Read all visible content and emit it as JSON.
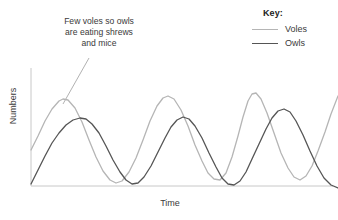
{
  "chart_data": {
    "type": "line",
    "title": "",
    "xlabel": "Time",
    "ylabel": "Numbers",
    "grid": false,
    "axes": {
      "x_axis_line": true,
      "y_axis_line": true,
      "ticks": false,
      "tick_labels": false,
      "plot_left": 31,
      "plot_right": 338,
      "plot_top": 60,
      "plot_bottom": 186
    },
    "legend": {
      "title": "Key:",
      "position": "top-right",
      "entries": [
        {
          "name": "Voles",
          "color": "#b5b5b5"
        },
        {
          "name": "Owls",
          "color": "#555555"
        }
      ]
    },
    "annotations": [
      {
        "text": "Few voles so owls are eating shrews and mice",
        "lines": [
          "Few voles so owls",
          "are eating shrews",
          "and mice"
        ],
        "leader_line_from": [
          89,
          58
        ],
        "leader_line_to": [
          63,
          104
        ]
      }
    ],
    "series": [
      {
        "name": "Voles",
        "color": "#b5b5b5",
        "width": 1.3,
        "cycles": 3.2,
        "phase_lead_fraction": 0.22,
        "points": [
          [
            31,
            150
          ],
          [
            38,
            136
          ],
          [
            45,
            121
          ],
          [
            52,
            109
          ],
          [
            59,
            101
          ],
          [
            63,
            99
          ],
          [
            68,
            100
          ],
          [
            75,
            108
          ],
          [
            82,
            122
          ],
          [
            89,
            140
          ],
          [
            96,
            157
          ],
          [
            103,
            171
          ],
          [
            110,
            180
          ],
          [
            116,
            183
          ],
          [
            122,
            181
          ],
          [
            129,
            172
          ],
          [
            136,
            158
          ],
          [
            143,
            140
          ],
          [
            150,
            121
          ],
          [
            157,
            106
          ],
          [
            163,
            98
          ],
          [
            168,
            96
          ],
          [
            174,
            99
          ],
          [
            181,
            110
          ],
          [
            188,
            126
          ],
          [
            195,
            145
          ],
          [
            202,
            161
          ],
          [
            208,
            173
          ],
          [
            214,
            179
          ],
          [
            220,
            180
          ],
          [
            226,
            173
          ],
          [
            232,
            157
          ],
          [
            238,
            136
          ],
          [
            243,
            117
          ],
          [
            248,
            101
          ],
          [
            252,
            94
          ],
          [
            256,
            93
          ],
          [
            261,
            99
          ],
          [
            267,
            113
          ],
          [
            274,
            133
          ],
          [
            281,
            153
          ],
          [
            288,
            168
          ],
          [
            294,
            177
          ],
          [
            300,
            180
          ],
          [
            306,
            176
          ],
          [
            312,
            166
          ],
          [
            318,
            151
          ],
          [
            325,
            132
          ],
          [
            331,
            114
          ],
          [
            338,
            96
          ]
        ]
      },
      {
        "name": "Owls",
        "color": "#555555",
        "width": 1.3,
        "cycles": 3.2,
        "points": [
          [
            31,
            184
          ],
          [
            38,
            170
          ],
          [
            45,
            156
          ],
          [
            52,
            143
          ],
          [
            59,
            133
          ],
          [
            66,
            125
          ],
          [
            73,
            120
          ],
          [
            80,
            118
          ],
          [
            86,
            119
          ],
          [
            92,
            124
          ],
          [
            99,
            133
          ],
          [
            106,
            146
          ],
          [
            113,
            160
          ],
          [
            120,
            172
          ],
          [
            126,
            180
          ],
          [
            132,
            184
          ],
          [
            138,
            183
          ],
          [
            144,
            177
          ],
          [
            151,
            166
          ],
          [
            158,
            152
          ],
          [
            165,
            138
          ],
          [
            171,
            127
          ],
          [
            177,
            120
          ],
          [
            183,
            117
          ],
          [
            189,
            119
          ],
          [
            195,
            126
          ],
          [
            202,
            138
          ],
          [
            209,
            153
          ],
          [
            216,
            167
          ],
          [
            222,
            178
          ],
          [
            228,
            184
          ],
          [
            234,
            185
          ],
          [
            240,
            181
          ],
          [
            246,
            172
          ],
          [
            252,
            159
          ],
          [
            259,
            144
          ],
          [
            266,
            129
          ],
          [
            272,
            118
          ],
          [
            278,
            111
          ],
          [
            284,
            109
          ],
          [
            290,
            112
          ],
          [
            296,
            121
          ],
          [
            303,
            135
          ],
          [
            310,
            151
          ],
          [
            317,
            166
          ],
          [
            324,
            178
          ],
          [
            331,
            185
          ],
          [
            338,
            188
          ]
        ]
      }
    ]
  }
}
